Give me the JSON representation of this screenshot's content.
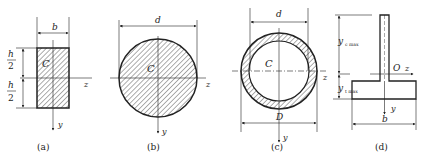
{
  "figure": {
    "panels": [
      {
        "id": "a",
        "caption": "(a)",
        "shape": "rectangle",
        "labels": {
          "width": "b",
          "half_height_num": "h",
          "half_height_den": "2",
          "centroid": "C",
          "z_axis": "z",
          "y_axis": "y"
        }
      },
      {
        "id": "b",
        "caption": "(b)",
        "shape": "solid-circle",
        "labels": {
          "diameter": "d",
          "centroid": "C",
          "z_axis": "z",
          "y_axis": "y"
        }
      },
      {
        "id": "c",
        "caption": "(c)",
        "shape": "hollow-circle",
        "labels": {
          "inner_diameter": "d",
          "outer_diameter": "D",
          "centroid": "C",
          "z_axis": "z",
          "y_axis": "y"
        }
      },
      {
        "id": "d",
        "caption": "(d)",
        "shape": "t-section",
        "labels": {
          "y_c_max": "y",
          "y_c_max_sub": "c max",
          "y_t_max": "y",
          "y_t_max_sub": "t max",
          "origin": "O",
          "z_axis": "z",
          "y_axis": "y",
          "width": "b"
        }
      }
    ],
    "colors": {
      "line": "#222222",
      "hatch": "#333333",
      "background": "#ffffff"
    }
  }
}
